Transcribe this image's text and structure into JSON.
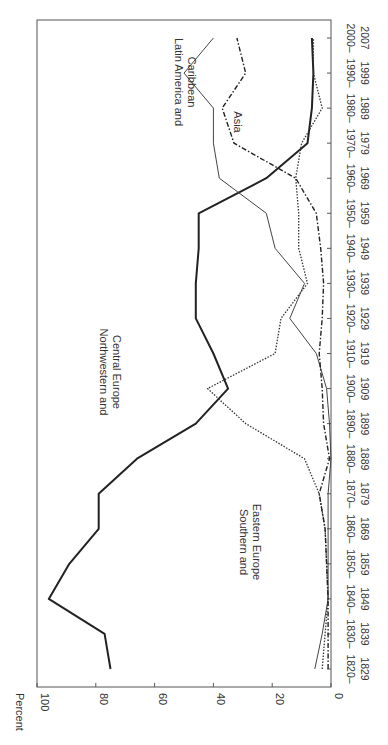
{
  "chart_data": {
    "type": "line",
    "orientation": "rotated-90",
    "title": "",
    "xlabel": "",
    "ylabel": "Percent",
    "ylim": [
      0,
      100
    ],
    "yticks": [
      0,
      20,
      40,
      60,
      80,
      100
    ],
    "grid": false,
    "legend_position": "inline labels",
    "categories": [
      [
        "1820–",
        "1829"
      ],
      [
        "1830–",
        "1839"
      ],
      [
        "1840–",
        "1849"
      ],
      [
        "1850–",
        "1859"
      ],
      [
        "1860–",
        "1869"
      ],
      [
        "1870–",
        "1879"
      ],
      [
        "1880–",
        "1889"
      ],
      [
        "1890–",
        "1899"
      ],
      [
        "1900–",
        "1909"
      ],
      [
        "1910–",
        "1919"
      ],
      [
        "1920–",
        "1929"
      ],
      [
        "1930–",
        "1939"
      ],
      [
        "1940–",
        "1949"
      ],
      [
        "1950–",
        "1959"
      ],
      [
        "1960–",
        "1969"
      ],
      [
        "1970–",
        "1979"
      ],
      [
        "1980–",
        "1989"
      ],
      [
        "1990–",
        "1999"
      ],
      [
        "2000–",
        "2007"
      ]
    ],
    "series": [
      {
        "name": "Northwestern and Central Europe",
        "label_lines": [
          "Northwestern and",
          "Central Europe"
        ],
        "style": "thick-solid",
        "values": [
          75,
          77,
          96,
          89,
          79,
          79,
          66,
          46,
          35,
          40,
          46,
          46,
          45,
          45,
          22,
          8,
          6.5,
          6,
          6.5
        ]
      },
      {
        "name": "Southern and Eastern Europe",
        "label_lines": [
          "Southern and",
          "Eastern Europe"
        ],
        "style": "dotted",
        "values": [
          3,
          2,
          1,
          1.5,
          2,
          4,
          9,
          29,
          42,
          19,
          17,
          8,
          11,
          11,
          12,
          10,
          3,
          6,
          6
        ]
      },
      {
        "name": "Latin America and Caribbean",
        "label_lines": [
          "Latin America and",
          "Caribbean"
        ],
        "style": "thin-solid",
        "values": [
          5.5,
          3,
          1,
          1,
          1,
          1,
          0,
          0.5,
          1.5,
          5,
          14,
          9,
          19,
          22,
          38,
          40,
          40,
          50,
          40
        ]
      },
      {
        "name": "Asia",
        "label_lines": [
          "Asia"
        ],
        "style": "dash-dot",
        "values": [
          1,
          1,
          1,
          1.5,
          2,
          4,
          0.5,
          2.5,
          3,
          4,
          3,
          2.5,
          3.5,
          5,
          12,
          33,
          37,
          29,
          32
        ]
      }
    ]
  },
  "axis": {
    "percent_label": "Percent",
    "percent_ticks": [
      "100",
      "80",
      "60",
      "40",
      "20",
      "0"
    ]
  },
  "footnote": "Source: Table 10.2 ..."
}
